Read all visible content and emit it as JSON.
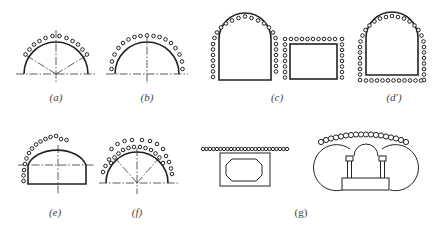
{
  "figure": {
    "type": "technical-diagram",
    "colors": {
      "line": "#222222",
      "background": "#ffffff",
      "label": "#444444"
    }
  },
  "panels": [
    {
      "id": "a",
      "label": "(a)",
      "shape": "semicircle-arch",
      "pipes": "arc over crown, 12 pipes, with 2 dash-dot radial center lines"
    },
    {
      "id": "b",
      "label": "(b)",
      "shape": "semicircle-arch",
      "pipes": "full arc down to springline, 18 pipes"
    },
    {
      "id": "c",
      "label": "(c)",
      "shape": "horseshoe + rectangle",
      "pipes": "arch and walls lined; rectangle perimeter lined"
    },
    {
      "id": "d",
      "label": "(d′)",
      "shape": "horseshoe closed",
      "pipes": "full perimeter including invert"
    },
    {
      "id": "e",
      "label": "(e)",
      "shape": "semicircle-on-wall",
      "pipes": "partial arc from left side over crown"
    },
    {
      "id": "f",
      "label": "(f)",
      "shape": "semicircle-arch",
      "pipes": "double row of pipes over crown"
    },
    {
      "id": "g",
      "label": "(g)",
      "shape": "box culvert + triple-arch",
      "pipes": "straight row above box; arched row above triple-arch"
    }
  ],
  "labels": {
    "a": "(a)",
    "b": "(b)",
    "c": "(c)",
    "d": "(d′)",
    "e": "(e)",
    "f": "(f)",
    "g": "(g)"
  }
}
